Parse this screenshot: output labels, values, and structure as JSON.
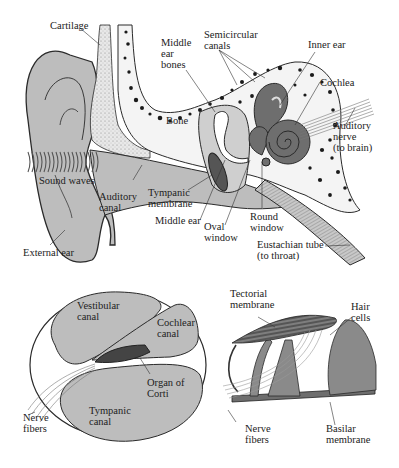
{
  "colors": {
    "tissue_fill": "#bdbdbd",
    "dark_fill": "#6e6e6e",
    "outline": "#2a2a2a",
    "background": "#ffffff",
    "bone_spot": "#1a1a1a"
  },
  "ear_diagram": {
    "labels": {
      "cartilage": "Cartilage",
      "semicircular_canals": "Semicircular\ncanals",
      "middle_ear_bones": "Middle\near\nbones",
      "inner_ear": "Inner ear",
      "bone": "Bone",
      "cochlea": "Cochlea",
      "auditory_nerve": "Auditory\nnerve\n(to brain)",
      "sound_waves": "Sound waves",
      "auditory_canal": "Auditory\ncanal",
      "tympanic_membrane": "Tympanic\nmembrane",
      "middle_ear": "Middle ear",
      "oval_window": "Oval\nwindow",
      "round_window": "Round\nwindow",
      "external_ear": "External ear",
      "eustachian_tube": "Eustachian tube\n(to throat)"
    }
  },
  "cochlea_cross_section": {
    "labels": {
      "vestibular_canal": "Vestibular\ncanal",
      "cochlear_canal": "Cochlear\ncanal",
      "organ_of_corti": "Organ of\nCorti",
      "tympanic_canal": "Tympanic\ncanal",
      "nerve_fibers": "Nerve\nfibers"
    }
  },
  "organ_of_corti_detail": {
    "labels": {
      "tectorial_membrane": "Tectorial\nmembrane",
      "hair_cells": "Hair\ncells",
      "nerve_fibers": "Nerve\nfibers",
      "basilar_membrane": "Basilar\nmembrane"
    }
  }
}
